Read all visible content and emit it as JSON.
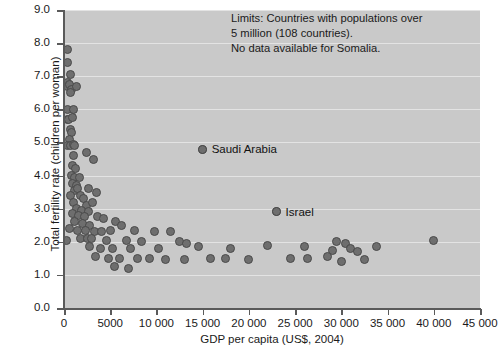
{
  "chart_data": {
    "type": "scatter",
    "title": "",
    "xlabel": "GDP per capita (US$, 2004)",
    "ylabel": "Total fertility rate (children per woman)",
    "xlim": [
      0,
      45000
    ],
    "ylim": [
      0,
      9
    ],
    "grid": true,
    "legend_position": "none",
    "xticks": [
      0,
      5000,
      10000,
      15000,
      20000,
      25000,
      30000,
      35000,
      40000,
      45000
    ],
    "xtick_labels": [
      "0",
      "5000",
      "10 000",
      "15 000",
      "20 000",
      "25 000",
      "30 000",
      "35 000",
      "40 000",
      "45 000"
    ],
    "yticks": [
      0,
      1,
      2,
      3,
      4,
      5,
      6,
      7,
      8,
      9
    ],
    "ytick_labels": [
      "0.0",
      "1.0",
      "2.0",
      "3.0",
      "4.0",
      "5.0",
      "6.0",
      "7.0",
      "8.0",
      "9.0"
    ],
    "annotation": "Limits: Countries with populations over\n5 million (108 countries).\nNo data available for Somalia.",
    "point_labels": [
      {
        "name": "Saudi Arabia",
        "x": 15000,
        "y": 4.8
      },
      {
        "name": "Israel",
        "x": 23000,
        "y": 2.9
      }
    ],
    "points": [
      {
        "x": 400,
        "y": 7.8
      },
      {
        "x": 350,
        "y": 7.4
      },
      {
        "x": 700,
        "y": 7.05
      },
      {
        "x": 330,
        "y": 6.8
      },
      {
        "x": 420,
        "y": 6.7
      },
      {
        "x": 600,
        "y": 6.75
      },
      {
        "x": 800,
        "y": 6.6
      },
      {
        "x": 1300,
        "y": 6.7
      },
      {
        "x": 650,
        "y": 6.5
      },
      {
        "x": 380,
        "y": 6.0
      },
      {
        "x": 1000,
        "y": 6.0
      },
      {
        "x": 350,
        "y": 5.7
      },
      {
        "x": 500,
        "y": 5.7
      },
      {
        "x": 950,
        "y": 5.75
      },
      {
        "x": 700,
        "y": 5.4
      },
      {
        "x": 800,
        "y": 5.3
      },
      {
        "x": 600,
        "y": 5.1
      },
      {
        "x": 420,
        "y": 4.9
      },
      {
        "x": 700,
        "y": 4.9
      },
      {
        "x": 1000,
        "y": 4.95
      },
      {
        "x": 1150,
        "y": 4.9
      },
      {
        "x": 1050,
        "y": 4.6
      },
      {
        "x": 2400,
        "y": 4.7
      },
      {
        "x": 3200,
        "y": 4.5
      },
      {
        "x": 900,
        "y": 4.3
      },
      {
        "x": 1250,
        "y": 4.2
      },
      {
        "x": 15000,
        "y": 4.8
      },
      {
        "x": 800,
        "y": 4.0
      },
      {
        "x": 1100,
        "y": 3.95
      },
      {
        "x": 1700,
        "y": 3.95
      },
      {
        "x": 950,
        "y": 3.75
      },
      {
        "x": 1350,
        "y": 3.7
      },
      {
        "x": 1150,
        "y": 3.55
      },
      {
        "x": 1500,
        "y": 3.6
      },
      {
        "x": 2700,
        "y": 3.6
      },
      {
        "x": 3500,
        "y": 3.5
      },
      {
        "x": 700,
        "y": 3.4
      },
      {
        "x": 1800,
        "y": 3.4
      },
      {
        "x": 2100,
        "y": 3.3
      },
      {
        "x": 1000,
        "y": 3.2
      },
      {
        "x": 2400,
        "y": 3.1
      },
      {
        "x": 3100,
        "y": 3.2
      },
      {
        "x": 1400,
        "y": 3.0
      },
      {
        "x": 1900,
        "y": 2.95
      },
      {
        "x": 2600,
        "y": 2.9
      },
      {
        "x": 900,
        "y": 2.85
      },
      {
        "x": 1600,
        "y": 2.8
      },
      {
        "x": 2200,
        "y": 2.75
      },
      {
        "x": 3600,
        "y": 2.75
      },
      {
        "x": 4300,
        "y": 2.7
      },
      {
        "x": 1100,
        "y": 2.6
      },
      {
        "x": 2000,
        "y": 2.55
      },
      {
        "x": 2800,
        "y": 2.5
      },
      {
        "x": 5600,
        "y": 2.6
      },
      {
        "x": 6200,
        "y": 2.5
      },
      {
        "x": 23000,
        "y": 2.9
      },
      {
        "x": 600,
        "y": 2.4
      },
      {
        "x": 1500,
        "y": 2.35
      },
      {
        "x": 2300,
        "y": 2.35
      },
      {
        "x": 3300,
        "y": 2.3
      },
      {
        "x": 4100,
        "y": 2.3
      },
      {
        "x": 5000,
        "y": 2.35
      },
      {
        "x": 7600,
        "y": 2.35
      },
      {
        "x": 9800,
        "y": 2.3
      },
      {
        "x": 11500,
        "y": 2.3
      },
      {
        "x": 300,
        "y": 2.05
      },
      {
        "x": 1800,
        "y": 2.1
      },
      {
        "x": 2500,
        "y": 2.1
      },
      {
        "x": 3000,
        "y": 2.1
      },
      {
        "x": 4600,
        "y": 2.05
      },
      {
        "x": 6800,
        "y": 2.05
      },
      {
        "x": 8400,
        "y": 2.0
      },
      {
        "x": 12500,
        "y": 2.0
      },
      {
        "x": 13300,
        "y": 1.95
      },
      {
        "x": 29500,
        "y": 2.0
      },
      {
        "x": 30500,
        "y": 1.95
      },
      {
        "x": 40000,
        "y": 2.05
      },
      {
        "x": 2800,
        "y": 1.85
      },
      {
        "x": 3900,
        "y": 1.8
      },
      {
        "x": 5200,
        "y": 1.8
      },
      {
        "x": 7200,
        "y": 1.8
      },
      {
        "x": 10200,
        "y": 1.8
      },
      {
        "x": 14500,
        "y": 1.85
      },
      {
        "x": 18000,
        "y": 1.8
      },
      {
        "x": 22000,
        "y": 1.9
      },
      {
        "x": 26000,
        "y": 1.85
      },
      {
        "x": 29000,
        "y": 1.75
      },
      {
        "x": 31000,
        "y": 1.8
      },
      {
        "x": 33800,
        "y": 1.85
      },
      {
        "x": 31800,
        "y": 1.7
      },
      {
        "x": 3400,
        "y": 1.55
      },
      {
        "x": 4800,
        "y": 1.5
      },
      {
        "x": 6000,
        "y": 1.5
      },
      {
        "x": 8000,
        "y": 1.5
      },
      {
        "x": 9200,
        "y": 1.5
      },
      {
        "x": 11000,
        "y": 1.45
      },
      {
        "x": 13000,
        "y": 1.45
      },
      {
        "x": 15800,
        "y": 1.5
      },
      {
        "x": 17500,
        "y": 1.5
      },
      {
        "x": 20000,
        "y": 1.45
      },
      {
        "x": 24500,
        "y": 1.5
      },
      {
        "x": 26300,
        "y": 1.5
      },
      {
        "x": 28500,
        "y": 1.55
      },
      {
        "x": 30000,
        "y": 1.4
      },
      {
        "x": 32500,
        "y": 1.45
      },
      {
        "x": 5500,
        "y": 1.25
      },
      {
        "x": 7000,
        "y": 1.2
      }
    ]
  }
}
